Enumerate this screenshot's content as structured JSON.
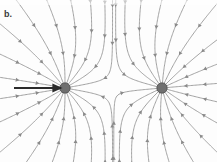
{
  "figure": {
    "panel_label": "b.",
    "caption": "",
    "background_color": "#fdfdfd",
    "width": 217,
    "height": 162
  },
  "chart_data": {
    "type": "scatter",
    "xlabel": "",
    "ylabel": "",
    "xlim": [
      0,
      217
    ],
    "ylim": [
      0,
      162
    ],
    "grid": false,
    "legend": "none",
    "annotations": [
      {
        "name": "panel-label",
        "text": "b.",
        "x": 6,
        "y": 14
      },
      {
        "name": "pointer-arrow",
        "text": "",
        "x1": 14,
        "y1": 88,
        "x2": 61,
        "y2": 88,
        "color": "#2b2b2b",
        "width": 2.2,
        "description": "black horizontal arrow pointing right at left charge"
      }
    ],
    "charges": [
      {
        "label": "left-charge",
        "sign": "negative",
        "x": 65,
        "y": 88,
        "radius": 5.2,
        "fill": "#6f6f6f",
        "stroke": "#4a4a4a"
      },
      {
        "label": "right-charge",
        "sign": "negative",
        "x": 162,
        "y": 88,
        "radius": 5.2,
        "fill": "#6f6f6f",
        "stroke": "#4a4a4a"
      }
    ],
    "field": {
      "line_color": "#9a9a9a",
      "line_width": 1.0,
      "arrow_color": "#8a8a8a",
      "arrow_direction": "inward",
      "lines_per_charge": 18,
      "arrowheads_per_line": 3
    }
  }
}
